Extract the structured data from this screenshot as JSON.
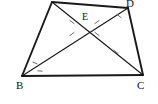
{
  "figure": {
    "kind": "geometry-diagram",
    "shape": "quadrilateral-with-diagonals",
    "stroke_color": "#1a1a1a",
    "tick_color": "#6b6b6b",
    "background_color": "#ffffff",
    "canvas": {
      "width": 158,
      "height": 104
    },
    "vertices": [
      {
        "id": "A",
        "label": "",
        "x": 52,
        "y": 2,
        "label_x": 0,
        "label_y": 0,
        "label_visible": false
      },
      {
        "id": "D",
        "label": "D",
        "x": 128,
        "y": 8,
        "label_x": 126,
        "label_y": -2,
        "label_visible": true
      },
      {
        "id": "C",
        "label": "C",
        "x": 143,
        "y": 75,
        "label_x": 137,
        "label_y": 80,
        "label_visible": true
      },
      {
        "id": "B",
        "label": "B",
        "x": 22,
        "y": 76,
        "label_x": 16,
        "label_y": 80,
        "label_visible": true
      },
      {
        "id": "E",
        "label": "E",
        "x": 84,
        "y": 28,
        "label_x": 82,
        "label_y": 12,
        "label_visible": true
      }
    ],
    "sides": [
      {
        "id": "side-AD",
        "from": "A",
        "to": "D"
      },
      {
        "id": "side-DC",
        "from": "D",
        "to": "C"
      },
      {
        "id": "side-CB",
        "from": "C",
        "to": "B"
      },
      {
        "id": "side-BA",
        "from": "B",
        "to": "A"
      }
    ],
    "diagonals": [
      {
        "id": "diagonal-BD",
        "from": "B",
        "to": "D"
      },
      {
        "id": "diagonal-AC",
        "from": "A",
        "to": "C"
      }
    ],
    "segment_ticks": [
      {
        "id": "tick-eb",
        "x": 72,
        "y": 34,
        "angle": -36
      },
      {
        "id": "tick-ea",
        "x": 72,
        "y": 22,
        "angle": 36
      },
      {
        "id": "tick-ed",
        "x": 97,
        "y": 22,
        "angle": -36
      },
      {
        "id": "tick-ec",
        "x": 97,
        "y": 34,
        "angle": 36
      },
      {
        "id": "tick-dc-upper",
        "x": 119,
        "y": 16,
        "angle": 38
      },
      {
        "id": "tick-ac-lower",
        "x": 116,
        "y": 52,
        "angle": 38
      }
    ],
    "angle_ticks": [
      {
        "id": "angle-b-upper",
        "x": 35,
        "y": 63,
        "angle": 22
      },
      {
        "id": "angle-b-lower",
        "x": 40,
        "y": 71,
        "angle": 5
      }
    ]
  }
}
